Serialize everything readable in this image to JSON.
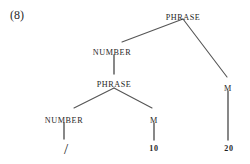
{
  "figure": {
    "example_number": "(8)",
    "caption": "",
    "background_color": "#ffffff",
    "line_color": "#555555",
    "text_color": "#262626"
  },
  "tree": {
    "type": "syntax-tree",
    "nodes": [
      {
        "id": "phrase-root",
        "label": "PHRASE",
        "kind": "category",
        "x": 183,
        "y": 13,
        "apex_x": 183,
        "apex_y": 19
      },
      {
        "id": "number-upper",
        "label": "NUMBER",
        "kind": "category",
        "x": 112,
        "y": 48,
        "apex_x": 112,
        "apex_y": 43
      },
      {
        "id": "phrase-inner",
        "label": "PHRASE",
        "kind": "category",
        "x": 114,
        "y": 80,
        "apex_x": 114,
        "apex_y": 88
      },
      {
        "id": "number-lower",
        "label": "NUMBER",
        "kind": "category",
        "x": 64,
        "y": 116,
        "apex_x": 64,
        "apex_y": 110
      },
      {
        "id": "m-inner",
        "label": "M",
        "kind": "category",
        "x": 154,
        "y": 116,
        "apex_x": 154,
        "apex_y": 110
      },
      {
        "id": "m-root-right",
        "label": "M",
        "kind": "category",
        "x": 228,
        "y": 84,
        "apex_x": 228,
        "apex_y": 78
      },
      {
        "id": "terminal-slash",
        "label": "/",
        "kind": "terminal",
        "x": 66,
        "y": 142
      },
      {
        "id": "terminal-ten",
        "label": "10",
        "kind": "terminal",
        "x": 154,
        "y": 144
      },
      {
        "id": "terminal-twenty",
        "label": "20",
        "kind": "terminal",
        "x": 229,
        "y": 144
      }
    ],
    "edges": [
      {
        "id": "edge-root-to-number",
        "from": "phrase-root",
        "to": "number-upper",
        "x1": 183,
        "y1": 19,
        "x2": 122,
        "y2": 42,
        "style": "diagonal"
      },
      {
        "id": "edge-root-to-m-right",
        "from": "phrase-root",
        "to": "m-root-right",
        "x1": 183,
        "y1": 19,
        "x2": 227,
        "y2": 77,
        "style": "diagonal"
      },
      {
        "id": "edge-number-to-phrase",
        "from": "number-upper",
        "to": "phrase-inner",
        "x1": 114,
        "y1": 55,
        "x2": 114,
        "y2": 74,
        "style": "vertical"
      },
      {
        "id": "edge-phrase-to-number",
        "from": "phrase-inner",
        "to": "number-lower",
        "x1": 114,
        "y1": 88,
        "x2": 74,
        "y2": 108,
        "style": "diagonal"
      },
      {
        "id": "edge-phrase-to-m",
        "from": "phrase-inner",
        "to": "m-inner",
        "x1": 114,
        "y1": 88,
        "x2": 152,
        "y2": 108,
        "style": "diagonal"
      },
      {
        "id": "edge-number-to-slash",
        "from": "number-lower",
        "to": "terminal-slash",
        "x1": 64,
        "y1": 123,
        "x2": 64,
        "y2": 139,
        "style": "vertical"
      },
      {
        "id": "edge-m-to-ten",
        "from": "m-inner",
        "to": "terminal-ten",
        "x1": 154,
        "y1": 123,
        "x2": 154,
        "y2": 140,
        "style": "vertical"
      },
      {
        "id": "edge-m-to-twenty",
        "from": "m-root-right",
        "to": "terminal-twenty",
        "x1": 228,
        "y1": 91,
        "x2": 228,
        "y2": 140,
        "style": "vertical"
      }
    ]
  }
}
